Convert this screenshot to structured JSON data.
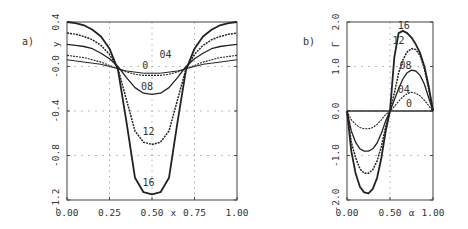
{
  "chart_data": [
    {
      "type": "line",
      "panel_label": "a)",
      "title": "",
      "xlabel": "x",
      "ylabel": "y",
      "xlim": [
        0.0,
        1.0
      ],
      "ylim": [
        -1.2,
        0.4
      ],
      "xticks": [
        "0.00",
        "0.25",
        "0.50",
        "0.75",
        "1.00"
      ],
      "yticks": [
        "0.4",
        "-0.0",
        "-0.4",
        "-0.8",
        "-1.2"
      ],
      "grid": true,
      "x": [
        0.0,
        0.05,
        0.1,
        0.15,
        0.2,
        0.25,
        0.3,
        0.35,
        0.4,
        0.45,
        0.5,
        0.55,
        0.6,
        0.65,
        0.7,
        0.75,
        0.8,
        0.85,
        0.9,
        0.95,
        1.0
      ],
      "series": [
        {
          "name": "0",
          "values": [
            0.06,
            0.05,
            0.04,
            0.03,
            0.02,
            0.0,
            -0.02,
            -0.04,
            -0.05,
            -0.06,
            -0.06,
            -0.06,
            -0.05,
            -0.04,
            -0.02,
            0.0,
            0.02,
            0.03,
            0.04,
            0.05,
            0.06
          ]
        },
        {
          "name": "0.4",
          "values": [
            0.1,
            0.09,
            0.08,
            0.06,
            0.04,
            0.01,
            -0.02,
            -0.05,
            -0.07,
            -0.08,
            -0.08,
            -0.08,
            -0.07,
            -0.05,
            -0.02,
            0.01,
            0.04,
            0.06,
            0.08,
            0.09,
            0.1
          ]
        },
        {
          "name": "0.8",
          "values": [
            0.2,
            0.19,
            0.18,
            0.16,
            0.12,
            0.07,
            0.0,
            -0.1,
            -0.19,
            -0.24,
            -0.25,
            -0.24,
            -0.19,
            -0.1,
            0.0,
            0.07,
            0.12,
            0.16,
            0.18,
            0.19,
            0.2
          ]
        },
        {
          "name": "1.2",
          "values": [
            0.3,
            0.29,
            0.27,
            0.24,
            0.19,
            0.11,
            -0.02,
            -0.3,
            -0.58,
            -0.68,
            -0.7,
            -0.68,
            -0.58,
            -0.3,
            -0.02,
            0.11,
            0.19,
            0.24,
            0.27,
            0.29,
            0.3
          ]
        },
        {
          "name": "1.6",
          "values": [
            0.4,
            0.39,
            0.37,
            0.33,
            0.27,
            0.16,
            -0.03,
            -0.5,
            -1.0,
            -1.13,
            -1.15,
            -1.13,
            -1.0,
            -0.5,
            -0.03,
            0.16,
            0.27,
            0.33,
            0.37,
            0.39,
            0.4
          ]
        }
      ],
      "annotations": [
        {
          "text": "0",
          "x": 0.46,
          "y": -0.02
        },
        {
          "text": "04",
          "x": 0.58,
          "y": 0.08
        },
        {
          "text": "08",
          "x": 0.47,
          "y": -0.21
        },
        {
          "text": "12",
          "x": 0.48,
          "y": -0.62
        },
        {
          "text": "16",
          "x": 0.48,
          "y": -1.07
        }
      ]
    },
    {
      "type": "line",
      "panel_label": "b)",
      "title": "",
      "xlabel": "α",
      "ylabel": "Γ",
      "xlim": [
        0.0,
        1.0
      ],
      "ylim": [
        -2.0,
        2.0
      ],
      "xticks": [
        "0.00",
        "0.50",
        "1.00"
      ],
      "yticks": [
        "2.0",
        "1.0",
        "0.0",
        "-1.0",
        "-2.0"
      ],
      "grid": true,
      "x": [
        0.0,
        0.05,
        0.1,
        0.15,
        0.2,
        0.25,
        0.3,
        0.35,
        0.4,
        0.45,
        0.5,
        0.55,
        0.6,
        0.65,
        0.7,
        0.75,
        0.8,
        0.85,
        0.9,
        0.95,
        1.0
      ],
      "series": [
        {
          "name": "0",
          "values": [
            0.0,
            0.0,
            0.0,
            0.0,
            0.0,
            0.0,
            0.0,
            0.0,
            0.0,
            0.0,
            0.0,
            0.0,
            0.0,
            0.0,
            0.0,
            0.0,
            0.0,
            0.0,
            0.0,
            0.0,
            0.0
          ]
        },
        {
          "name": "0.4",
          "values": [
            0.0,
            -0.2,
            -0.3,
            -0.37,
            -0.4,
            -0.4,
            -0.37,
            -0.3,
            -0.2,
            -0.08,
            0.0,
            0.1,
            0.22,
            0.32,
            0.39,
            0.42,
            0.4,
            0.34,
            0.24,
            0.12,
            0.0
          ]
        },
        {
          "name": "0.8",
          "values": [
            0.0,
            -0.45,
            -0.7,
            -0.85,
            -0.9,
            -0.9,
            -0.85,
            -0.72,
            -0.5,
            -0.22,
            0.0,
            0.25,
            0.5,
            0.72,
            0.86,
            0.92,
            0.9,
            0.8,
            0.6,
            0.3,
            0.0
          ]
        },
        {
          "name": "1.2",
          "values": [
            0.0,
            -0.7,
            -1.05,
            -1.3,
            -1.4,
            -1.4,
            -1.32,
            -1.12,
            -0.8,
            -0.35,
            0.0,
            0.4,
            0.85,
            1.15,
            1.33,
            1.4,
            1.38,
            1.25,
            0.95,
            0.5,
            0.0
          ]
        },
        {
          "name": "1.6",
          "values": [
            0.0,
            -0.9,
            -1.4,
            -1.7,
            -1.83,
            -1.85,
            -1.75,
            -1.5,
            -1.05,
            -0.45,
            0.0,
            1.2,
            1.75,
            1.8,
            1.75,
            1.65,
            1.5,
            1.3,
            1.0,
            0.55,
            0.0
          ]
        }
      ],
      "annotations": [
        {
          "text": "16",
          "x": 0.66,
          "y": 1.85
        },
        {
          "text": "12",
          "x": 0.6,
          "y": 1.5
        },
        {
          "text": "08",
          "x": 0.68,
          "y": 0.95
        },
        {
          "text": "04",
          "x": 0.66,
          "y": 0.4
        },
        {
          "text": "0",
          "x": 0.72,
          "y": 0.1
        }
      ]
    }
  ]
}
